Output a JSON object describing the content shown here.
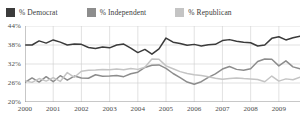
{
  "legend": {
    "items": [
      {
        "label": "% Democrat",
        "color": "#3b3b3b"
      },
      {
        "label": "% Independent",
        "color": "#8d8d8d"
      },
      {
        "label": "% Republican",
        "color": "#c4c4c4"
      }
    ]
  },
  "chart_data": {
    "type": "line",
    "title": "",
    "subtitle": "",
    "xlabel": "",
    "ylabel": "",
    "xlim": [
      2000,
      2009.75
    ],
    "ylim": [
      20,
      44
    ],
    "ytick_labels": [
      "44%",
      "38%",
      "32%",
      "26%",
      "20%"
    ],
    "ytick_values": [
      44,
      38,
      32,
      26,
      20
    ],
    "xtick_labels": [
      "2000",
      "2001",
      "2002",
      "2003",
      "2004",
      "2005",
      "2006",
      "2007",
      "2008",
      "2009"
    ],
    "xtick_values": [
      2000,
      2001,
      2002,
      2003,
      2004,
      2005,
      2006,
      2007,
      2008,
      2009
    ],
    "grid": true,
    "legend_position": "top-left",
    "x": [
      2000.0,
      2000.25,
      2000.5,
      2000.75,
      2001.0,
      2001.25,
      2001.5,
      2001.75,
      2002.0,
      2002.25,
      2002.5,
      2002.75,
      2003.0,
      2003.25,
      2003.5,
      2003.75,
      2004.0,
      2004.25,
      2004.5,
      2004.75,
      2005.0,
      2005.25,
      2005.5,
      2005.75,
      2006.0,
      2006.25,
      2006.5,
      2006.75,
      2007.0,
      2007.25,
      2007.5,
      2007.75,
      2008.0,
      2008.25,
      2008.5,
      2008.75,
      2009.0,
      2009.25,
      2009.5,
      2009.75
    ],
    "series": [
      {
        "name": "% Democrat",
        "color": "#3b3b3b",
        "values": [
          38.0,
          38.0,
          39.3,
          38.6,
          39.6,
          38.9,
          38.0,
          38.3,
          38.2,
          37.2,
          36.9,
          37.4,
          37.1,
          38.0,
          38.3,
          37.0,
          35.6,
          36.6,
          35.1,
          36.8,
          40.2,
          38.9,
          38.5,
          37.9,
          38.2,
          37.7,
          38.1,
          38.2,
          39.4,
          39.7,
          39.2,
          38.9,
          38.7,
          37.7,
          38.0,
          40.1,
          40.6,
          39.6,
          40.3,
          40.8
        ]
      },
      {
        "name": "% Independent",
        "color": "#8d8d8d",
        "values": [
          26.2,
          27.6,
          26.3,
          28.0,
          26.4,
          28.3,
          26.9,
          28.2,
          27.6,
          27.5,
          28.6,
          28.1,
          28.2,
          28.4,
          28.0,
          28.9,
          29.4,
          30.9,
          31.6,
          31.7,
          30.6,
          29.0,
          27.7,
          26.3,
          25.6,
          26.4,
          27.8,
          28.9,
          30.4,
          31.2,
          30.3,
          30.0,
          30.5,
          32.8,
          33.6,
          33.5,
          31.4,
          33.0,
          31.1,
          30.5
        ]
      },
      {
        "name": "% Republican",
        "color": "#c4c4c4",
        "values": [
          26.6,
          26.2,
          27.4,
          26.6,
          27.7,
          26.5,
          29.3,
          27.8,
          29.7,
          30.0,
          30.1,
          30.3,
          30.2,
          30.4,
          30.2,
          30.6,
          30.3,
          31.0,
          33.6,
          33.5,
          31.4,
          30.5,
          29.6,
          29.0,
          28.6,
          28.4,
          28.0,
          27.5,
          27.2,
          27.4,
          27.6,
          27.4,
          27.3,
          27.1,
          26.4,
          28.2,
          26.6,
          27.3,
          27.0,
          27.8
        ]
      }
    ]
  }
}
